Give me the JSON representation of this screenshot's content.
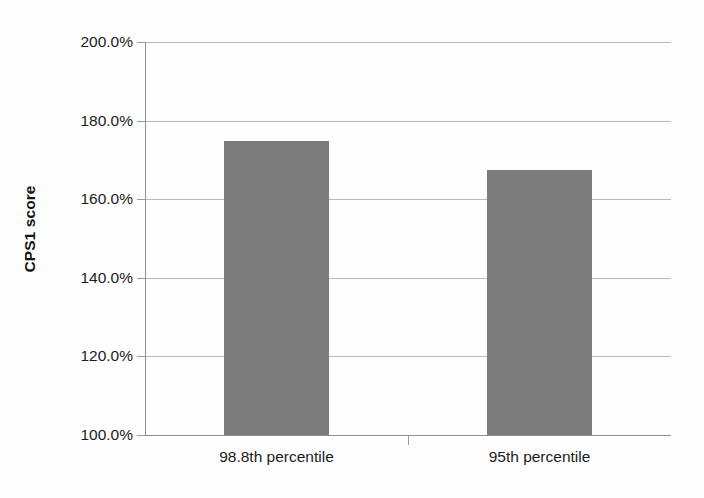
{
  "chart_data": {
    "type": "bar",
    "title": "",
    "subtitle": "",
    "xlabel": "",
    "ylabel": "CPS1 score",
    "categories": [
      "98.8th percentile",
      "95th percentile"
    ],
    "values": [
      174.8,
      167.4
    ],
    "value_labels": [
      "174.8%",
      "167.4%"
    ],
    "ylim": [
      100.0,
      200.0
    ],
    "ytick_values": [
      100.0,
      120.0,
      140.0,
      160.0,
      180.0,
      200.0
    ],
    "ytick_labels": [
      "100.0%",
      "120.0%",
      "140.0%",
      "160.0%",
      "180.0%",
      "200.0%"
    ],
    "grid": true,
    "grid_axis": "y",
    "legend": false,
    "legend_position": "none",
    "series": [
      {
        "name": "CPS1 score",
        "values": [
          174.8,
          167.4
        ],
        "color": "#7b7b7b"
      }
    ],
    "annotations": []
  },
  "style": {
    "bar_color": "#7b7b7b",
    "gridline_color": "#b9b9b9",
    "axis_color": "#8f8f8f",
    "text_color": "#1c1c1c",
    "background": "#fefefe"
  }
}
